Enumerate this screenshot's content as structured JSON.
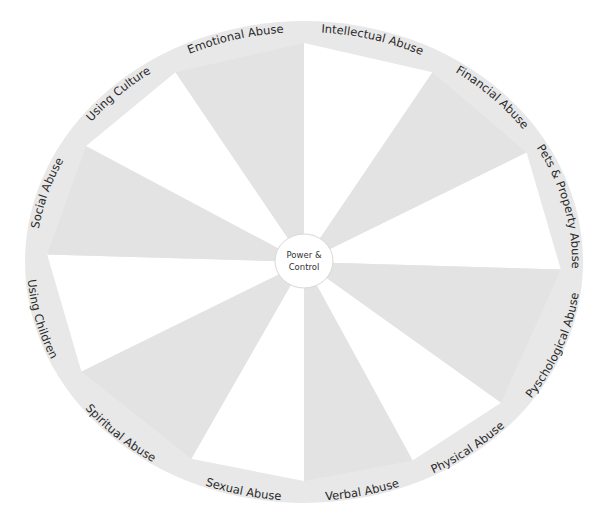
{
  "diagram": {
    "type": "power-and-control-wheel",
    "center": {
      "line1": "Power &",
      "line2": "Control"
    },
    "colors": {
      "ring": "#e8e8e8",
      "wedge_shaded": "#e3e3e3",
      "wedge_plain": "#ffffff",
      "center_fill": "#ffffff",
      "center_stroke": "#dcdcdc",
      "text": "#2a2a2a"
    },
    "segments": [
      {
        "label": "Intellectual Abuse",
        "start": 0,
        "end": 30,
        "shade": "plain"
      },
      {
        "label": "Financial Abuse",
        "start": 30,
        "end": 60,
        "shade": "shaded"
      },
      {
        "label": "Pets & Property Abuse",
        "start": 60,
        "end": 92,
        "shade": "plain"
      },
      {
        "label": "Pyschological Abuse",
        "start": 92,
        "end": 130,
        "shade": "shaded"
      },
      {
        "label": "Physical Abuse",
        "start": 130,
        "end": 155,
        "shade": "plain"
      },
      {
        "label": "Verbal Abuse",
        "start": 155,
        "end": 180,
        "shade": "shaded"
      },
      {
        "label": "Sexual Abuse",
        "start": 180,
        "end": 206,
        "shade": "plain"
      },
      {
        "label": "Spiritual Abuse",
        "start": 206,
        "end": 240,
        "shade": "shaded"
      },
      {
        "label": "Using Children",
        "start": 240,
        "end": 272,
        "shade": "plain"
      },
      {
        "label": "Social Abuse",
        "start": 272,
        "end": 302,
        "shade": "shaded"
      },
      {
        "label": "Using Culture",
        "start": 302,
        "end": 330,
        "shade": "plain"
      },
      {
        "label": "Emotional Abuse",
        "start": 330,
        "end": 360,
        "shade": "shaded"
      }
    ]
  }
}
